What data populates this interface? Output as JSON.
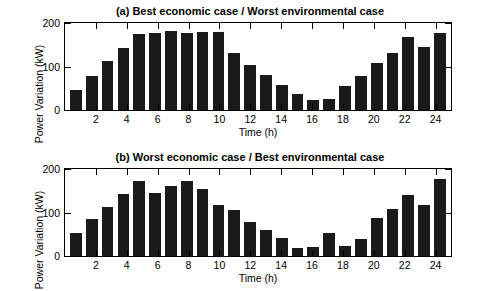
{
  "figure": {
    "background": "#ffffff",
    "bar_color": "#1a1a1a"
  },
  "chart_data": [
    {
      "type": "bar",
      "title": "(a) Best economic case / Worst environmental case",
      "xlabel": "Time (h)",
      "ylabel": "Power Variation (kW)",
      "xlim": [
        0,
        25
      ],
      "ylim": [
        0,
        200
      ],
      "yticks": [
        0,
        100,
        200
      ],
      "xticks": [
        2,
        4,
        6,
        8,
        10,
        12,
        14,
        16,
        18,
        20,
        22,
        24
      ],
      "grid": false,
      "legend": "none",
      "x": [
        1,
        2,
        3,
        4,
        5,
        6,
        7,
        8,
        9,
        10,
        11,
        12,
        13,
        14,
        15,
        16,
        17,
        18,
        19,
        20,
        21,
        22,
        23,
        24
      ],
      "values": [
        45,
        78,
        112,
        143,
        175,
        176,
        181,
        178,
        180,
        179,
        130,
        103,
        80,
        58,
        36,
        24,
        25,
        55,
        78,
        108,
        130,
        168,
        146,
        177
      ]
    },
    {
      "type": "bar",
      "title": "(b) Worst economic case / Best environmental case",
      "xlabel": "Time (h)",
      "ylabel": "Power Variation (kW)",
      "xlim": [
        0,
        25
      ],
      "ylim": [
        0,
        200
      ],
      "yticks": [
        0,
        100,
        200
      ],
      "xticks": [
        2,
        4,
        6,
        8,
        10,
        12,
        14,
        16,
        18,
        20,
        22,
        24
      ],
      "grid": false,
      "legend": "none",
      "x": [
        1,
        2,
        3,
        4,
        5,
        6,
        7,
        8,
        9,
        10,
        11,
        12,
        13,
        14,
        15,
        16,
        17,
        18,
        19,
        20,
        21,
        22,
        23,
        24
      ],
      "values": [
        52,
        84,
        112,
        143,
        172,
        146,
        160,
        172,
        155,
        118,
        106,
        78,
        60,
        42,
        18,
        21,
        52,
        22,
        40,
        88,
        108,
        141,
        118,
        178
      ]
    }
  ]
}
